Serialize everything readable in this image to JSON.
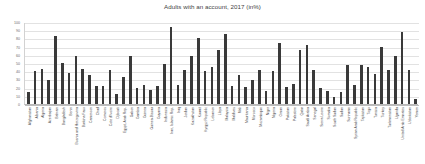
{
  "chart_data": {
    "type": "bar",
    "title": "Adults with an account, 2017 (in%)",
    "xlabel": "",
    "ylabel": "",
    "ylim": [
      0,
      100
    ],
    "yticks": [
      0,
      10,
      20,
      30,
      40,
      50,
      60,
      70,
      80,
      90,
      100
    ],
    "grid": true,
    "legend": "none",
    "bar_color": "#3a3a3a",
    "categories": [
      "Afghanistan",
      "Albania",
      "Algeria",
      "Azerbaijan",
      "Bahrain",
      "Bangladesh",
      "Benin",
      "Bosnia and Herzegovina",
      "Burkina Faso",
      "Cameroon",
      "Chad",
      "Comoros",
      "Cote d'Ivoire",
      "Djibouti",
      "Egypt, Arab Rep.",
      "Gabon",
      "Gambia",
      "Guinea",
      "Guinea-Bissau",
      "Guyana",
      "Indonesia",
      "Iran, Islamic Rep.",
      "Iraq",
      "Jordan",
      "Kazakhstan",
      "Kuwait",
      "Kyrgyz Republic",
      "Lebanon",
      "Libya",
      "Malaysia",
      "Maldives",
      "Mali",
      "Mauritania",
      "Morocco",
      "Mozambique",
      "Niger",
      "Nigeria",
      "Oman",
      "Pakistan",
      "Palestine",
      "Qatar",
      "Saudi Arabia",
      "Senegal",
      "Sierra Leone",
      "Somalia",
      "South Sudan",
      "Sudan",
      "Suriname",
      "Syrian Arab Republic",
      "Tajikistan",
      "Togo",
      "Tunisia",
      "Turkey",
      "Turkmenistan",
      "Uganda",
      "United Arab Emirates",
      "Uzbekistan",
      "Yemen"
    ],
    "values": [
      15,
      40,
      43,
      29,
      83,
      50,
      38,
      59,
      43,
      35,
      22,
      22,
      41,
      12,
      33,
      59,
      19,
      23,
      17,
      22,
      49,
      94,
      23,
      42,
      59,
      80,
      40,
      45,
      66,
      85,
      22,
      35,
      21,
      29,
      42,
      16,
      40,
      74,
      21,
      25,
      66,
      72,
      42,
      20,
      16,
      9,
      15,
      48,
      23,
      47,
      45,
      37,
      69,
      41,
      59,
      88,
      41,
      6
    ]
  }
}
